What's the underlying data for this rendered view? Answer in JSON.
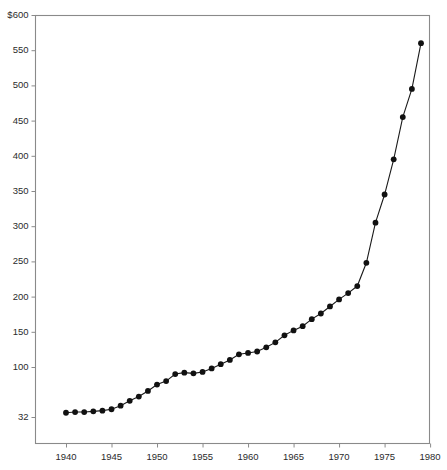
{
  "chart_data": {
    "type": "line",
    "title": "",
    "subtitle": "",
    "xlabel": "",
    "ylabel": "",
    "currency_prefix": "$",
    "xlim": [
      1938.6,
      1981.0
    ],
    "ylim": [
      10,
      600
    ],
    "grid": false,
    "legend": null,
    "marker": "filled-circle",
    "line_color": "#1a1a1a",
    "marker_color": "#111111",
    "axis_color": "#8a8a8a",
    "background_color": "#ffffff",
    "y_ticks": [
      600,
      550,
      500,
      450,
      400,
      350,
      300,
      250,
      200,
      150,
      100,
      32
    ],
    "y_tick_labels": [
      "$600",
      "550",
      "500",
      "450",
      "400",
      "350",
      "300",
      "250",
      "200",
      "150",
      "100",
      "32"
    ],
    "x_ticks": [
      1940,
      1945,
      1950,
      1955,
      1960,
      1965,
      1970,
      1975,
      1980
    ],
    "x_tick_labels": [
      "1940",
      "1945",
      "1950",
      "1955",
      "1960",
      "1965",
      "1970",
      "1975",
      "1980"
    ],
    "x": [
      1940,
      1941,
      1942,
      1943,
      1944,
      1945,
      1946,
      1947,
      1948,
      1949,
      1950,
      1951,
      1952,
      1953,
      1954,
      1955,
      1956,
      1957,
      1958,
      1959,
      1960,
      1961,
      1962,
      1963,
      1964,
      1965,
      1966,
      1967,
      1968,
      1969,
      1970,
      1971,
      1972,
      1973,
      1974,
      1975,
      1976,
      1977,
      1978,
      1979,
      1980
    ],
    "values": [
      35,
      36,
      36,
      37,
      38,
      40,
      45,
      52,
      58,
      66,
      75,
      80,
      90,
      92,
      91,
      93,
      98,
      104,
      110,
      118,
      120,
      122,
      128,
      135,
      145,
      152,
      158,
      168,
      176,
      186,
      196,
      205,
      215,
      248,
      305,
      345,
      395,
      455,
      495,
      560,
      560
    ],
    "series": [
      {
        "name": "value",
        "x": [
          1940,
          1941,
          1942,
          1943,
          1944,
          1945,
          1946,
          1947,
          1948,
          1949,
          1950,
          1951,
          1952,
          1953,
          1954,
          1955,
          1956,
          1957,
          1958,
          1959,
          1960,
          1961,
          1962,
          1963,
          1964,
          1965,
          1966,
          1967,
          1968,
          1969,
          1970,
          1971,
          1972,
          1973,
          1974,
          1975,
          1976,
          1977,
          1978,
          1979
        ],
        "values": [
          35,
          36,
          36,
          37,
          38,
          40,
          45,
          52,
          58,
          66,
          75,
          80,
          90,
          92,
          91,
          93,
          98,
          104,
          110,
          118,
          120,
          122,
          128,
          135,
          145,
          152,
          158,
          168,
          176,
          186,
          196,
          205,
          215,
          248,
          305,
          345,
          395,
          455,
          495,
          560
        ]
      }
    ]
  }
}
